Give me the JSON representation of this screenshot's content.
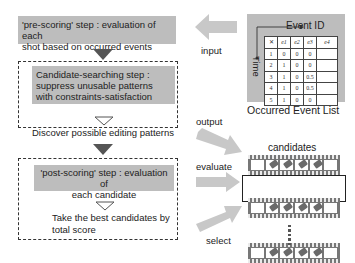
{
  "steps": {
    "pre_scoring": {
      "text_line1": "'pre-scoring' step : evaluation of each",
      "text_line2": "shot based on occurred events"
    },
    "candidate_search": {
      "line1": "Candidate-searching step :",
      "line2": "suppress unusable patterns",
      "line3": "with constraints-satisfaction",
      "result": "Discover possible editing patterns"
    },
    "post_scoring": {
      "line1": "'post-scoring' step : evaluation of",
      "line2": "each candidate",
      "result_line1": "Take the best candidates by",
      "result_line2": "total score"
    }
  },
  "arrows": {
    "input": "input",
    "output": "output",
    "evaluate": "evaluate",
    "select": "select"
  },
  "event_list": {
    "caption": "Occurred Event List",
    "x_axis": "Event ID",
    "y_axis": "Time",
    "headers": [
      "",
      "e1",
      "e2",
      "e3",
      "e4"
    ],
    "rows": [
      [
        "1",
        "0",
        "0",
        "0",
        ""
      ],
      [
        "2",
        "1",
        "0",
        "0",
        ""
      ],
      [
        "3",
        "1",
        "0",
        "0.5",
        ""
      ],
      [
        "4",
        "1",
        "0",
        "0.5",
        ""
      ],
      [
        "5",
        "1",
        "0",
        "0",
        ""
      ]
    ]
  },
  "candidates": {
    "title": "candidates",
    "ellipsis": "⋮",
    "strip_count": 3,
    "selected_index": 1
  }
}
